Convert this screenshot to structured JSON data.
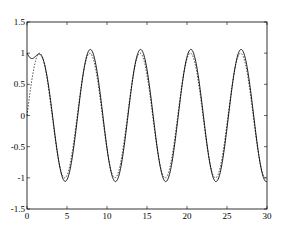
{
  "chart_data": {
    "type": "line",
    "title": "",
    "xlabel": "",
    "ylabel": "",
    "xlim": [
      0,
      30
    ],
    "ylim": [
      -1.5,
      1.5
    ],
    "grid": false,
    "legend": null,
    "xticks": [
      0,
      5,
      10,
      15,
      20,
      25,
      30
    ],
    "xtick_labels": [
      "0",
      "5",
      "10",
      "15",
      "20",
      "25",
      "30"
    ],
    "yticks": [
      -1.5,
      -1,
      -0.5,
      0,
      0.5,
      1,
      1.5
    ],
    "ytick_labels": [
      "-1.5",
      "-1",
      "-0.5",
      "0",
      "0.5",
      "1",
      "1.5"
    ],
    "series": [
      {
        "name": "solid",
        "style": "solid",
        "color": "#000000",
        "description": "Oscillation starting at y=1, overshoot to ~1.1 at t~1.6, then steady sinusoid amplitude ~1.06, period ~6.28",
        "x": [
          0,
          1.6,
          4.7,
          7.9,
          11.0,
          14.2,
          17.3,
          20.5,
          23.6,
          26.7,
          29.9,
          30
        ],
        "values": [
          1.0,
          1.1,
          -1.07,
          1.06,
          -1.06,
          1.06,
          -1.06,
          1.06,
          -1.06,
          1.06,
          -1.05,
          -1.04
        ]
      },
      {
        "name": "dashed",
        "style": "dashed",
        "color": "#000000",
        "description": "Reference sinusoid sin(t), amplitude ~1.0, starting at 0",
        "x": [
          0,
          1.57,
          4.71,
          7.85,
          11.0,
          14.14,
          17.28,
          20.42,
          23.56,
          26.7,
          29.85,
          30
        ],
        "values": [
          0,
          1.0,
          -1.0,
          1.0,
          -1.0,
          1.0,
          -1.0,
          1.0,
          -1.0,
          1.0,
          -1.0,
          -0.99
        ]
      }
    ]
  }
}
